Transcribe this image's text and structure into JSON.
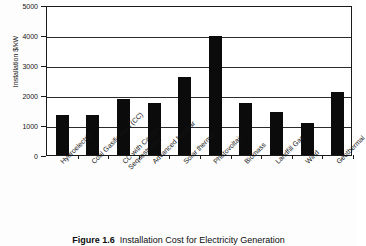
{
  "figure": {
    "caption_label": "Figure 1.6",
    "caption_text": "Installation Cost for Electricity Generation"
  },
  "chart_data": {
    "type": "bar",
    "title": "Installation Cost for Electricity Generation",
    "xlabel": "",
    "ylabel": "Installation $/kW",
    "ylim": [
      0,
      5000
    ],
    "ytick_labels": [
      "5000",
      "4000",
      "3000",
      "2000",
      "1000",
      "0"
    ],
    "ytick_values": [
      5000,
      4000,
      3000,
      2000,
      1000,
      0
    ],
    "grid": true,
    "legend": false,
    "bar_color": "#0b0b0b",
    "categories": [
      "Hydroelectric",
      "Coal Gasification (CC)",
      "CC with Carbon Sequestration",
      "Advanced Nuclear",
      "Solar thermal",
      "Photovoltaic",
      "Biomass",
      "Landfill Gas",
      "Wind",
      "Geothermal"
    ],
    "category_lines": [
      [
        "Hydroelectric"
      ],
      [
        "Coal Gasification (CC)"
      ],
      [
        "CC with Carbon",
        "Sequestration"
      ],
      [
        "Advanced Nuclear"
      ],
      [
        "Solar thermal"
      ],
      [
        "Photovoltaic"
      ],
      [
        "Biomass"
      ],
      [
        "Landfill Gas"
      ],
      [
        "Wind"
      ],
      [
        "Geothermal"
      ]
    ],
    "values": [
      1330,
      1350,
      1880,
      1750,
      2590,
      3960,
      1750,
      1430,
      1060,
      2090
    ]
  }
}
